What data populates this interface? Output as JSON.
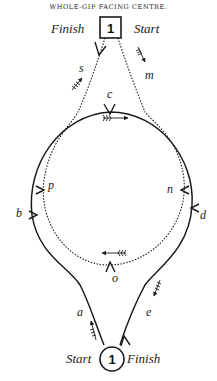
{
  "title": "WHOLE-GIP FACING CENTRE.",
  "top_station": {
    "number": "1",
    "left_label": "Finish",
    "right_label": "Start"
  },
  "bottom_station": {
    "number": "1",
    "left_label": "Start",
    "right_label": "Finish"
  },
  "points": {
    "s": "s",
    "m": "m",
    "c": "c",
    "p": "p",
    "b": "b",
    "n": "n",
    "d": "d",
    "o": "o",
    "a": "a",
    "e": "e"
  },
  "paths": {
    "solid": "outer track: bottom start -> a -> b -> c -> d -> e -> bottom finish",
    "dotted": "inner track: top start -> m -> n -> o -> p -> c -> s -> top finish"
  },
  "colors": {
    "ink": "#1a1a1a",
    "paper": "#ffffff"
  }
}
